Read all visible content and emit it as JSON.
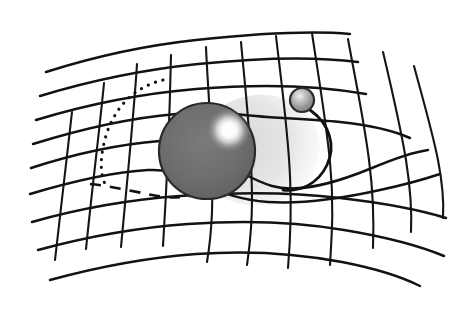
{
  "figure": {
    "background_color": "#ffffff",
    "width": 455,
    "height": 309,
    "style": "hand-drawn line illustration, grayscale"
  },
  "palette": {
    "line_color": "#121212",
    "sphere_fill": "#6e6e6e",
    "sphere_fill_dark": "#5a5a5a",
    "sphere_outline": "#2a2a2a",
    "highlight_color": "#ffffff",
    "small_sphere_fill": "#8a8a8a",
    "shadow_color": "#dedede",
    "background": "#ffffff"
  },
  "objects": {
    "large_sphere": {
      "name": "massive-body",
      "cx": 207,
      "cy": 151,
      "r": 48,
      "highlight_cx": 229,
      "highlight_cy": 130,
      "highlight_r": 19,
      "fill": "#6e6e6e"
    },
    "small_sphere": {
      "name": "orbiting-body",
      "cx": 302,
      "cy": 100,
      "r": 12,
      "highlight_cx": 299,
      "highlight_cy": 96,
      "highlight_r": 6,
      "fill": "#8a8a8a"
    },
    "light_shadow": {
      "name": "curvature-shading",
      "fill": "#dedede"
    }
  },
  "paths": {
    "orbit_curve": "M 310 110 C 330 124 336 146 327 165 C 318 184 300 192 283 190",
    "dotted_trail": "M 163 80 C 147 84 133 92 123 104 C 112 117 106 132 103 148 C 100 163 101 175 105 184",
    "dashed_trail": "M 90 184 C 110 186 132 191 152 195 C 168 198 180 198 190 196"
  },
  "grid": {
    "description": "warped rectangular mesh, rubber-sheet deformation",
    "vertical_lines": 11,
    "horizontal_lines": 9,
    "verticals": [
      "M 72 112 C 68 150 62 196 55 260",
      "M 104 83 C 100 126 93 180 86 249",
      "M 137 64 C 134 112 128 172 121 247",
      "M 171 55 C 170 103 168 166 163 246",
      "M 206 47 C 208 96 214 152 212 212 C 211 236 209 250 207 262",
      "M 241 42 C 245 88 252 142 252 200 C 252 232 249 250 247 265",
      "M 276 36 C 281 80 288 130 290 176 C 292 216 290 244 288 268",
      "M 312 33 C 318 74 326 120 330 162 C 334 202 332 232 330 265",
      "M 348 39 C 355 78 364 120 369 160 C 374 198 374 222 373 248",
      "M 383 52 C 391 86 400 124 406 160 C 411 192 412 212 411 232",
      "M 414 66 C 422 96 432 130 438 160 C 443 186 444 202 443 218"
    ],
    "horizontals": [
      "M 46 72 C 90 58 140 46 196 40 C 252 34 306 30 350 34",
      "M 40 96 C 86 82 140 70 198 64 C 256 58 312 56 358 62",
      "M 36 120 C 82 106 136 94 196 89 C 256 84 316 85 366 94",
      "M 33 144 C 78 130 130 118 176 114 C 200 112 218 111 236 114 C 262 118 304 118 340 122 C 368 125 392 130 410 138",
      "M 31 168 C 74 154 122 144 160 141 C 178 140 194 144 208 152 C 226 162 246 178 272 186 C 300 194 338 182 372 168 C 396 158 414 152 428 150",
      "M 30 194 C 70 182 112 172 148 170 C 170 169 186 174 200 182 C 218 192 240 200 268 202 C 300 204 344 198 380 190 C 408 184 428 178 440 174",
      "M 32 222 C 74 210 124 200 180 196 C 236 192 292 192 340 198 C 384 203 420 210 446 218",
      "M 38 250 C 82 238 132 228 188 224 C 244 220 298 222 344 230 C 386 237 420 246 444 256",
      "M 50 280 C 94 268 142 258 196 254 C 250 250 300 254 342 262 C 378 269 404 278 420 286"
    ]
  },
  "annotations": {
    "has_axis_labels": false,
    "has_legend": false,
    "has_text": false
  }
}
